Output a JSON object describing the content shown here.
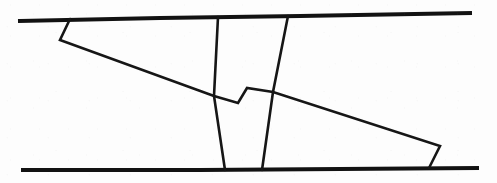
{
  "figure": {
    "width": 497,
    "height": 183,
    "background_color": "#fdfdfd",
    "stroke_color": "#121212",
    "caption": ""
  },
  "chart_data": {
    "type": "line",
    "xlabel": "",
    "ylabel": "",
    "grid": false,
    "legend": "none",
    "xlim": [
      0,
      497
    ],
    "ylim": [
      0,
      183
    ],
    "coordinate_system": "image-pixels-top-left-origin",
    "series": [
      {
        "name": "top-boundary-line",
        "description": "Upper near-horizontal boundary of the band, sloping slightly upward to the right",
        "closed": false,
        "points": [
          [
            20,
            21
          ],
          [
            160,
            18
          ],
          [
            300,
            16
          ],
          [
            470,
            13
          ]
        ]
      },
      {
        "name": "bottom-boundary-line",
        "description": "Lower near-horizontal boundary of the band",
        "closed": false,
        "points": [
          [
            23,
            170
          ],
          [
            200,
            170
          ],
          [
            340,
            169
          ],
          [
            477,
            168
          ]
        ]
      },
      {
        "name": "left-notch-and-long-diagonal",
        "description": "Small notch descending from the top line at left, then a long diagonal crossing the band down to the right, with a step kink near the middle, ending in a notch at the bottom right",
        "closed": false,
        "points": [
          [
            70,
            19
          ],
          [
            60,
            40
          ],
          [
            214,
            96
          ],
          [
            238,
            103
          ],
          [
            247,
            88
          ],
          [
            273,
            92
          ],
          [
            440,
            146
          ],
          [
            429,
            168
          ]
        ]
      },
      {
        "name": "left-interior-vertical",
        "description": "Interior near-vertical line from the top boundary down to the bottom boundary, leaning right",
        "closed": false,
        "points": [
          [
            218,
            17
          ],
          [
            214,
            96
          ],
          [
            225,
            170
          ]
        ]
      },
      {
        "name": "right-interior-vertical",
        "description": "Interior near-vertical line from the top boundary down to the bottom boundary, leaning left",
        "closed": false,
        "points": [
          [
            288,
            16
          ],
          [
            273,
            92
          ],
          [
            262,
            170
          ]
        ]
      }
    ],
    "vertices_of_interest": [
      {
        "name": "top-left-notch-apex",
        "x": 70,
        "y": 19
      },
      {
        "name": "left-notch-bottom",
        "x": 60,
        "y": 40
      },
      {
        "name": "step-lower-corner",
        "x": 238,
        "y": 103
      },
      {
        "name": "step-upper-corner",
        "x": 247,
        "y": 88
      },
      {
        "name": "bottom-right-notch-apex",
        "x": 440,
        "y": 146
      },
      {
        "name": "bottom-right-notch-foot",
        "x": 429,
        "y": 168
      }
    ]
  }
}
